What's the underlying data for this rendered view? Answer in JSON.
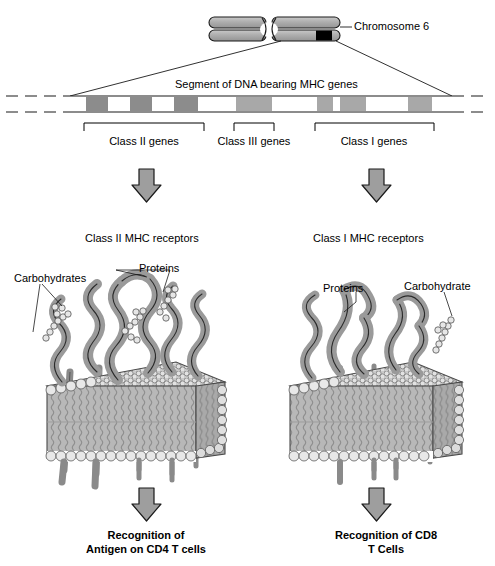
{
  "figure": {
    "title_text": "Chromosome 6",
    "segment_label": "Segment of DNA bearing MHC genes",
    "gene_class_labels": {
      "class2": "Class II genes",
      "class3": "Class III genes",
      "class1": "Class I genes"
    },
    "panels": {
      "left": {
        "heading": "Class II MHC receptors",
        "carb_label": "Carbohydrates",
        "protein_label": "Proteins",
        "outcome_line1": "Recognition of",
        "outcome_line2": "Antigen on CD4 T cells"
      },
      "right": {
        "heading": "Class I MHC receptors",
        "carb_label": "Carbohydrate",
        "protein_label": "Proteins",
        "outcome_line1": "Recognition of CD8",
        "outcome_line2": "T Cells"
      }
    },
    "colors": {
      "background": "#ffffff",
      "ink": "#000000",
      "chromatid_fill": "#b3b3b3",
      "mhc_band": "#000000",
      "gene_band_dark": "#8c8c8c",
      "gene_band_light": "#a8a8a8",
      "arrow_fill": "#9e9e9e",
      "protein_fill": "#9a9a9a",
      "membrane_fill": "#b8b8b8",
      "lipid_head": "#dcdcdc"
    },
    "dna_bands": [
      {
        "group": "class2",
        "x": 86,
        "w": 22,
        "shade": "dark"
      },
      {
        "group": "class2",
        "x": 130,
        "w": 22,
        "shade": "dark"
      },
      {
        "group": "class2",
        "x": 174,
        "w": 24,
        "shade": "dark"
      },
      {
        "group": "class3",
        "x": 236,
        "w": 36,
        "shade": "light"
      },
      {
        "group": "class1",
        "x": 317,
        "w": 16,
        "shade": "light"
      },
      {
        "group": "class1",
        "x": 340,
        "w": 26,
        "shade": "light"
      },
      {
        "group": "class1",
        "x": 408,
        "w": 24,
        "shade": "light"
      }
    ],
    "brackets": [
      {
        "group": "class2",
        "x1": 84,
        "x2": 204,
        "label_x": 144,
        "label_y": 141
      },
      {
        "group": "class3",
        "x1": 234,
        "x2": 274,
        "label_x": 254,
        "label_y": 141
      },
      {
        "group": "class1",
        "x1": 315,
        "x2": 434,
        "label_x": 374,
        "label_y": 141
      }
    ]
  }
}
